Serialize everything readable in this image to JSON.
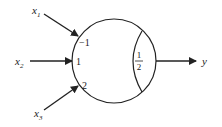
{
  "diagram": {
    "type": "threshold-neuron",
    "inputs": [
      {
        "name": "x",
        "subscript": "1",
        "weight": "−1"
      },
      {
        "name": "x",
        "subscript": "2",
        "weight": "1"
      },
      {
        "name": "x",
        "subscript": "3",
        "weight": "2"
      }
    ],
    "threshold": {
      "numerator": "1",
      "denominator": "2"
    },
    "output": {
      "name": "y"
    },
    "colors": {
      "stroke": "#222222",
      "background": "#ffffff"
    }
  }
}
